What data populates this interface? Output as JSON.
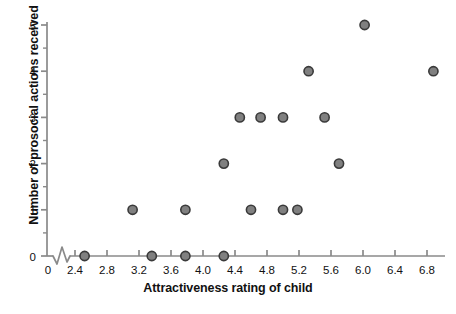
{
  "chart_data": {
    "type": "scatter",
    "title": "",
    "xlabel": "Attractiveness rating of child",
    "ylabel": "Number of prosocial actions received",
    "xlim": [
      2.2,
      7.0
    ],
    "ylim": [
      0,
      5
    ],
    "grid": false,
    "legend": null,
    "axis_break_x": true,
    "x_origin_label": "0",
    "xticks": [
      2.4,
      2.8,
      3.2,
      3.6,
      4.0,
      4.4,
      4.8,
      5.2,
      5.6,
      6.0,
      6.4,
      6.8
    ],
    "xtick_labels": [
      "2.4",
      "2.8",
      "3.2",
      "3.6",
      "4.0",
      "4.4",
      "4.8",
      "5.2",
      "5.6",
      "6.0",
      "6.4",
      "6.8"
    ],
    "yticks": [
      0,
      1,
      2,
      3,
      4,
      5
    ],
    "ytick_labels": [
      "0",
      "1",
      "2",
      "3",
      "4",
      "5"
    ],
    "y_minor_ticks": [
      0.5,
      1.5,
      2.5,
      3.5,
      4.5
    ],
    "marker": {
      "shape": "circle",
      "fill": "#808080",
      "edge": "#3a3a3a",
      "radius": 4.6,
      "edge_width": 1.6
    },
    "axis_color": "#8a8a8a",
    "text_color": "#111111",
    "points": [
      {
        "x": 2.52,
        "y": 0
      },
      {
        "x": 3.36,
        "y": 0
      },
      {
        "x": 3.78,
        "y": 0
      },
      {
        "x": 4.26,
        "y": 0
      },
      {
        "x": 3.12,
        "y": 1
      },
      {
        "x": 3.78,
        "y": 1
      },
      {
        "x": 4.6,
        "y": 1
      },
      {
        "x": 5.0,
        "y": 1
      },
      {
        "x": 5.18,
        "y": 1
      },
      {
        "x": 4.26,
        "y": 2
      },
      {
        "x": 5.7,
        "y": 2
      },
      {
        "x": 4.46,
        "y": 3
      },
      {
        "x": 4.72,
        "y": 3
      },
      {
        "x": 5.0,
        "y": 3
      },
      {
        "x": 5.52,
        "y": 3
      },
      {
        "x": 5.32,
        "y": 4
      },
      {
        "x": 6.88,
        "y": 4
      },
      {
        "x": 6.02,
        "y": 5
      }
    ]
  },
  "axis_labels": {
    "x": "Attractiveness rating of child",
    "y": "Number of prosocial actions received"
  }
}
